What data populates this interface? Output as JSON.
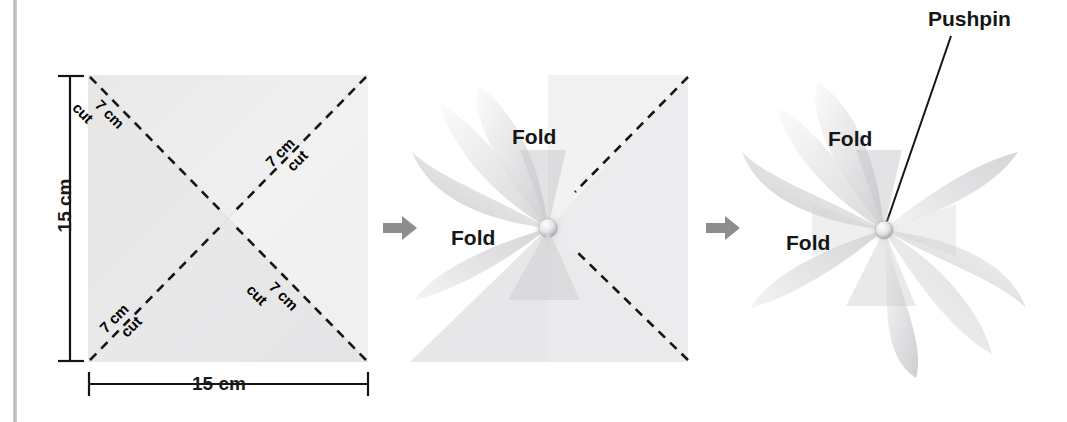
{
  "figure": {
    "background_color": "#ffffff",
    "paper_color": "#ededee",
    "line_color": "#1a1a1a",
    "arrow_color": "#8d8d8d",
    "rule_color": "#c4c4c4"
  },
  "steps": [
    {
      "id": "step-1-square",
      "name": "square-with-cut-lines",
      "dimensions": {
        "height_label": "15 cm",
        "width_label": "15 cm"
      },
      "cut_labels": [
        {
          "position": "top-left",
          "length": "7 cm",
          "action": "cut",
          "rotation": 45
        },
        {
          "position": "top-right",
          "length": "7 cm",
          "action": "cut",
          "rotation": -45
        },
        {
          "position": "bottom-left",
          "length": "7 cm",
          "action": "cut",
          "rotation": -45
        },
        {
          "position": "bottom-right",
          "length": "7 cm",
          "action": "cut",
          "rotation": 45
        }
      ]
    },
    {
      "id": "step-2-partial-fold",
      "name": "partially-folded-pinwheel",
      "fold_labels": [
        "Fold",
        "Fold"
      ]
    },
    {
      "id": "step-3-complete",
      "name": "completed-pinwheel",
      "fold_labels": [
        "Fold",
        "Fold"
      ],
      "callout": "Pushpin"
    }
  ],
  "arrows": [
    {
      "name": "arrow-step1-to-step2",
      "direction": "right"
    },
    {
      "name": "arrow-step2-to-step3",
      "direction": "right"
    }
  ]
}
